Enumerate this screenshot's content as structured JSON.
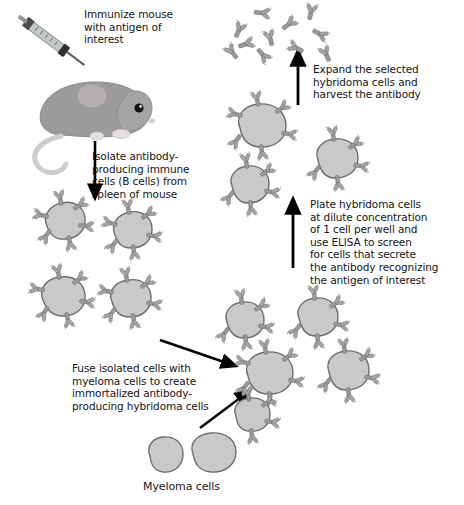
{
  "figure": {
    "background_color": "#ffffff",
    "cell_fill": "#c9c9c9",
    "cell_stroke": "#6e6e6e",
    "antibody_color": "#9a9a9a",
    "arrow_color": "#000000",
    "mouse_body_color": "#9b9b9b",
    "mouse_ear_color": "#b9b2b2",
    "mouse_tail_color": "#cfcccc",
    "mouse_foot_color": "#e6dede",
    "syringe_color": "#b9bdbd",
    "text_color": "#141414"
  },
  "steps": [
    {
      "id": "immunize",
      "text": "Immunize mouse\nwith antigen of\ninterest"
    },
    {
      "id": "isolate",
      "text": "Isolate antibody-\nproducing immune\ncells (B cells) from\nspleen of mouse"
    },
    {
      "id": "fuse",
      "text": "Fuse isolated cells with\nmyeloma cells to create\nimmortalized antibody-\nproducing hybridoma cells"
    },
    {
      "id": "plate",
      "text": "Plate hybridoma cells\nat dilute concentration\nof 1 cell per well and\nuse ELISA to screen\nfor cells that secrete\nthe antibody recognizing\nthe antigen of interest"
    },
    {
      "id": "expand",
      "text": "Expand the selected\nhybridoma cells and\nharvest the antibody"
    }
  ],
  "labels": {
    "myeloma_cells": "Myeloma cells"
  },
  "elements": {
    "mouse": "immunized-mouse",
    "syringe": "syringe-with-antigen",
    "b_cells_count": 4,
    "myeloma_cells_count": 2,
    "hybridoma_cells_middle_count": 5,
    "hybridoma_cells_selected_count": 3,
    "free_antibodies_count": 11
  },
  "arrows": [
    {
      "id": "arrow-mouse-to-bcells",
      "direction": "down"
    },
    {
      "id": "arrow-bcells-to-fusion",
      "direction": "down-right"
    },
    {
      "id": "arrow-myeloma-to-fusion",
      "direction": "up-right"
    },
    {
      "id": "arrow-hybridoma-to-plate",
      "direction": "up"
    },
    {
      "id": "arrow-plate-to-expand",
      "direction": "up"
    }
  ]
}
